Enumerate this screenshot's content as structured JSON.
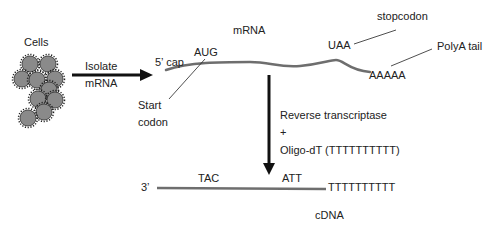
{
  "diagram": {
    "labels": {
      "cells": "Cells",
      "isolate_line1": "Isolate",
      "isolate_line2": "mRNA",
      "mrna": "mRNA",
      "five_cap": "5’ cap",
      "aug": "AUG",
      "start_line1": "Start",
      "start_line2": "codon",
      "uaa": "UAA",
      "stopcodon": "stopcodon",
      "polya_tail": "PolyA tail",
      "aaaaa": "AAAAA",
      "reverse_transcriptase": "Reverse transcriptase",
      "plus": "+",
      "oligo_dt": "Oligo-dT (TTTTTTTTTT)",
      "three_prime": "3’",
      "tac": "TAC",
      "att": "ATT",
      "t_tail": "TTTTTTTTTT",
      "cdna": "cDNA"
    },
    "colors": {
      "strand": "#6e6e6e",
      "cell_fill": "#8a8a8a",
      "cell_edge": "#222222",
      "arrow": "#111111",
      "text": "#222222"
    },
    "cells": [
      {
        "cx": 30,
        "cy": 64
      },
      {
        "cx": 48,
        "cy": 64
      },
      {
        "cx": 22,
        "cy": 79
      },
      {
        "cx": 37,
        "cy": 80
      },
      {
        "cx": 55,
        "cy": 79
      },
      {
        "cx": 49,
        "cy": 90
      },
      {
        "cx": 38,
        "cy": 99
      },
      {
        "cx": 55,
        "cy": 100
      },
      {
        "cx": 44,
        "cy": 112
      },
      {
        "cx": 28,
        "cy": 118
      }
    ]
  }
}
